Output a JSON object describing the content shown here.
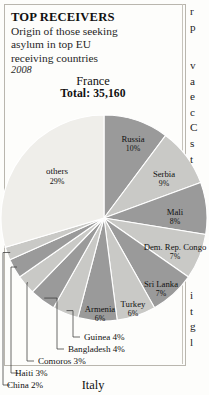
{
  "header": {
    "title": "TOP RECEIVERS",
    "subtitle_line1": "Origin of those seeking",
    "subtitle_line2": "asylum in top EU",
    "subtitle_line3": "receiving countries",
    "year": "2008"
  },
  "caption": {
    "country": "France",
    "total": "Total: 35,160"
  },
  "next_chart_title": "Italy",
  "colors": {
    "slice_dark": "#9a9a9a",
    "slice_light": "#c9c9c6",
    "slice_others": "#efeeea",
    "outline": "#ffffff",
    "text": "#111111",
    "leader": "#3a3a3a",
    "frame": "#b9b6ae"
  },
  "bleed_text": {
    "block_a": [
      "r",
      "p"
    ],
    "block_b": [
      "v",
      "a",
      "e",
      "c",
      "C",
      "s",
      "t"
    ],
    "block_c": [
      "i",
      "t",
      "g",
      "l"
    ]
  },
  "chart_data": {
    "type": "pie",
    "title": "France",
    "subtitle": "Total: 35,160",
    "unit": "percent",
    "total_value": 35160,
    "labels_inside": [
      "Russia",
      "Serbia",
      "Mali",
      "Dem. Rep. Congo",
      "Sri Lanka",
      "Turkey",
      "Armenia",
      "others"
    ],
    "labels_callout": [
      "Guinea 4%",
      "Bangladesh 4%",
      "Comoros 3%",
      "Haiti 3%",
      "China 2%"
    ],
    "categories": [
      "Russia",
      "Serbia",
      "Mali",
      "Dem. Rep. Congo",
      "Sri Lanka",
      "Turkey",
      "Armenia",
      "Guinea",
      "Bangladesh",
      "Comoros",
      "Haiti",
      "China",
      "others"
    ],
    "values": [
      10,
      9,
      8,
      7,
      7,
      6,
      6,
      4,
      4,
      3,
      3,
      2,
      29
    ],
    "slices": [
      {
        "name": "Russia",
        "pct": 10,
        "label": "Russia",
        "pct_label": "10%",
        "tone": "dark",
        "lx": 133,
        "ly": 140
      },
      {
        "name": "Serbia",
        "pct": 9,
        "label": "Serbia",
        "pct_label": "9%",
        "tone": "light",
        "lx": 164,
        "ly": 175
      },
      {
        "name": "Mali",
        "pct": 8,
        "label": "Mali",
        "pct_label": "8%",
        "tone": "dark",
        "lx": 175,
        "ly": 213
      },
      {
        "name": "Dem. Rep. Congo",
        "pct": 7,
        "label": "Dem. Rep. Congo",
        "pct_label": "7%",
        "tone": "light",
        "lx": 175,
        "ly": 248
      },
      {
        "name": "Sri Lanka",
        "pct": 7,
        "label": "Sri Lanka",
        "pct_label": "7%",
        "tone": "dark",
        "lx": 161,
        "ly": 285
      },
      {
        "name": "Turkey",
        "pct": 6,
        "label": "Turkey",
        "pct_label": "6%",
        "tone": "light",
        "lx": 133,
        "ly": 305
      },
      {
        "name": "Armenia",
        "pct": 6,
        "label": "Armenia",
        "pct_label": "6%",
        "tone": "dark",
        "lx": 100,
        "ly": 310
      },
      {
        "name": "Guinea",
        "pct": 4,
        "label": "Guinea 4%",
        "pct_label": "4%",
        "tone": "light",
        "callout": true,
        "cx": 73,
        "cy": 337,
        "tx": 77,
        "ty": 340
      },
      {
        "name": "Bangladesh",
        "pct": 4,
        "label": "Bangladesh 4%",
        "pct_label": "4%",
        "tone": "dark",
        "callout": true,
        "cx": 57,
        "cy": 349,
        "tx": 61,
        "ty": 352
      },
      {
        "name": "Comoros",
        "pct": 3,
        "label": "Comoros 3%",
        "pct_label": "3%",
        "tone": "light",
        "callout": true,
        "cx": 27,
        "cy": 361,
        "tx": 31,
        "ty": 364
      },
      {
        "name": "Haiti",
        "pct": 3,
        "label": "Haiti 3%",
        "pct_label": "3%",
        "tone": "dark",
        "callout": true,
        "cx": 11,
        "cy": 373,
        "tx": 8,
        "ty": 376
      },
      {
        "name": "China",
        "pct": 2,
        "label": "China 2%",
        "pct_label": "2%",
        "tone": "light",
        "callout": true,
        "cx": 3,
        "cy": 385,
        "tx": 0,
        "ty": 388
      },
      {
        "name": "others",
        "pct": 29,
        "label": "others",
        "pct_label": "29%",
        "tone": "others",
        "lx": 57,
        "ly": 172
      }
    ],
    "geometry": {
      "cx": 104,
      "cy": 218,
      "r": 103,
      "start_angle_deg": -90
    }
  }
}
